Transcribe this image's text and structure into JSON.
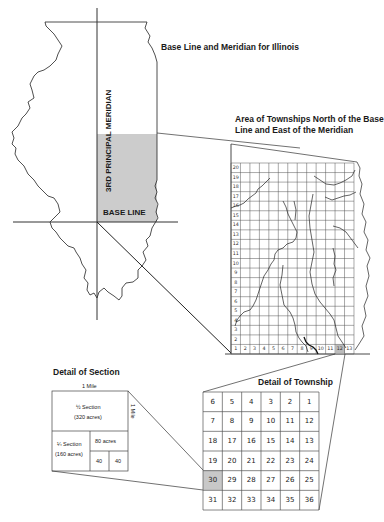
{
  "titles": {
    "illinois": "Base Line and Meridian for Illinois",
    "area": "Area of Townships North of the Base Line and East of the Meridian",
    "area_line1": "Area of Townships North of the Base",
    "area_line2": "Line and East of the Meridian",
    "section": "Detail of Section",
    "township": "Detail of Township"
  },
  "illinois_map": {
    "meridian_label": "3RD PRINCIPAL MERIDIAN",
    "base_line_label": "BASE LINE",
    "shade_color": "#cccccc"
  },
  "township_area_grid": {
    "rows": [
      20,
      19,
      18,
      17,
      16,
      15,
      14,
      13,
      12,
      11,
      10,
      9,
      8,
      7,
      6,
      5,
      4,
      3,
      2,
      1
    ],
    "columns": [
      1,
      2,
      3,
      4,
      5,
      6,
      7,
      8,
      9,
      10,
      11,
      12,
      13
    ],
    "highlighted_column": 12,
    "highlight_color": "#bbbbbb"
  },
  "section_detail": {
    "top_label": "1 Mile",
    "side_label": "1 Mile",
    "half_section": "½ Section",
    "half_acres": "(320 acres)",
    "quarter_section": "¼ Section",
    "quarter_acres": "(160 acres)",
    "eighty": "80 acres",
    "forty_a": "40",
    "forty_b": "40"
  },
  "township_detail": {
    "rows": [
      [
        "6",
        "5",
        "4",
        "3",
        "2",
        "1"
      ],
      [
        "7",
        "8",
        "9",
        "10",
        "11",
        "12"
      ],
      [
        "18",
        "17",
        "16",
        "15",
        "14",
        "13"
      ],
      [
        "19",
        "20",
        "21",
        "22",
        "23",
        "24"
      ],
      [
        "30",
        "29",
        "28",
        "27",
        "26",
        "25"
      ],
      [
        "31",
        "32",
        "33",
        "34",
        "35",
        "36"
      ]
    ],
    "highlighted_section": "30",
    "highlight_color": "#c8c8c8"
  }
}
